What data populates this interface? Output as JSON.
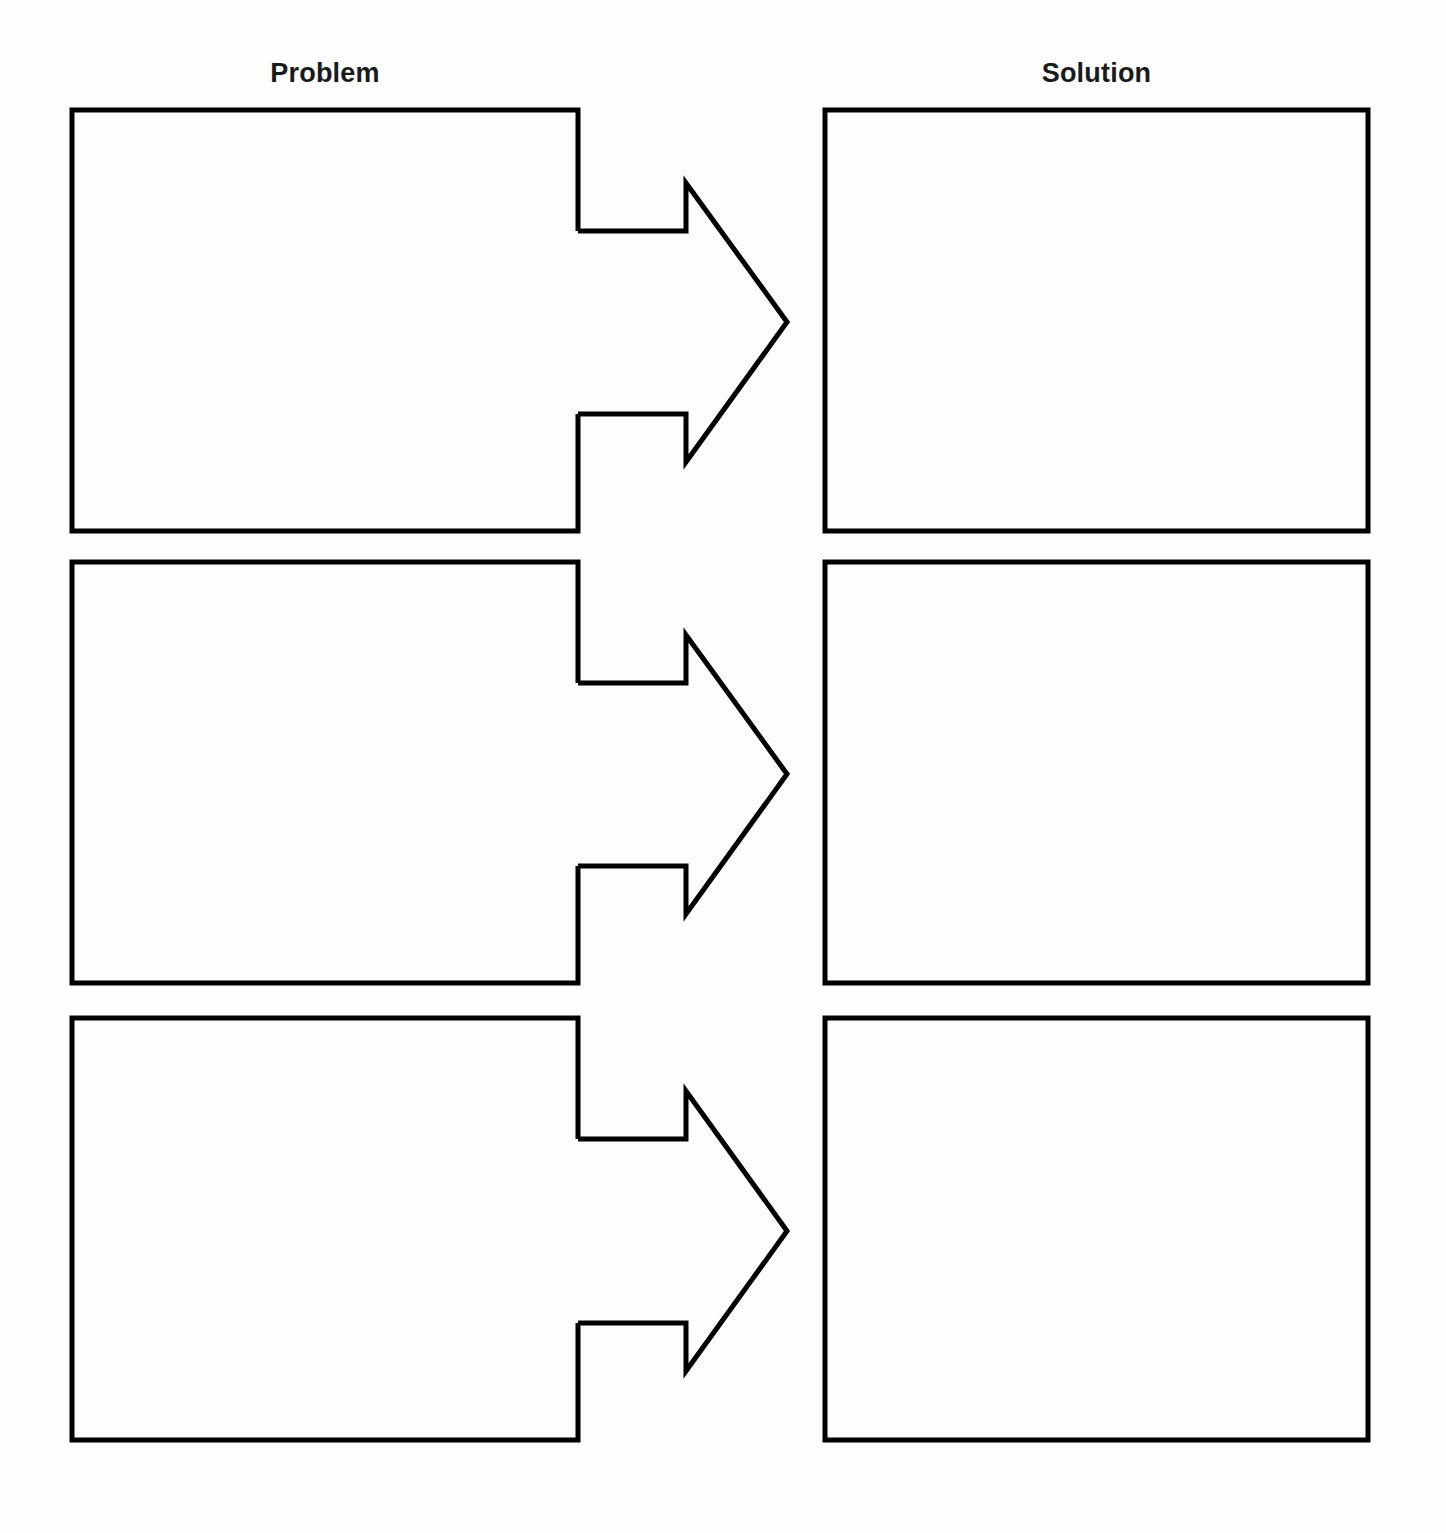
{
  "page": {
    "width": 1446,
    "height": 1533,
    "background_color": "#fdfdfd",
    "stroke_color": "#000000",
    "stroke_width": 5
  },
  "headers": {
    "problem": "Problem",
    "solution": "Solution"
  },
  "rows": [
    {
      "id": "row-1",
      "problem_text": "",
      "solution_text": "",
      "arrow_label": "",
      "geometry": {
        "box_top": 110,
        "box_bottom": 531,
        "problem_left": 72,
        "problem_right": 578,
        "solution_left": 825,
        "solution_right": 1368,
        "shaft_top": 231,
        "shaft_bottom": 414,
        "notch_x": 686,
        "head_top": 183,
        "head_bottom": 462,
        "tip_x": 787,
        "tip_y": 322
      }
    },
    {
      "id": "row-2",
      "problem_text": "",
      "solution_text": "",
      "arrow_label": "",
      "geometry": {
        "box_top": 562,
        "box_bottom": 983,
        "problem_left": 72,
        "problem_right": 578,
        "solution_left": 825,
        "solution_right": 1368,
        "shaft_top": 683,
        "shaft_bottom": 866,
        "notch_x": 686,
        "head_top": 635,
        "head_bottom": 914,
        "tip_x": 787,
        "tip_y": 774
      }
    },
    {
      "id": "row-3",
      "problem_text": "",
      "solution_text": "",
      "arrow_label": "",
      "geometry": {
        "box_top": 1018,
        "box_bottom": 1440,
        "problem_left": 72,
        "problem_right": 578,
        "solution_left": 825,
        "solution_right": 1368,
        "shaft_top": 1139,
        "shaft_bottom": 1323,
        "notch_x": 686,
        "head_top": 1091,
        "head_bottom": 1371,
        "tip_x": 787,
        "tip_y": 1231
      }
    }
  ]
}
